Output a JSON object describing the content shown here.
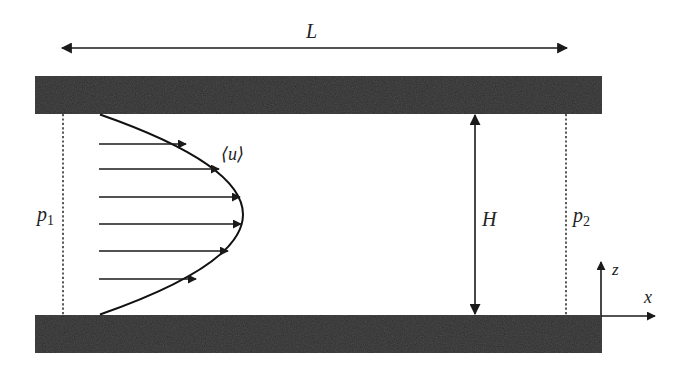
{
  "diagram": {
    "labels": {
      "length": "L",
      "height": "H",
      "velocity": "⟨u⟩",
      "pressure_inlet_base": "p",
      "pressure_inlet_sub": "1",
      "pressure_outlet_base": "p",
      "pressure_outlet_sub": "2",
      "axis_x": "x",
      "axis_z": "z"
    },
    "elements": {
      "top_plate": "solid wall (top)",
      "bottom_plate": "solid wall (bottom)",
      "velocity_profile": "parabolic profile",
      "velocity_arrow_count": 6,
      "inlet_boundary": "dotted line",
      "outlet_boundary": "dotted line"
    },
    "colors": {
      "plate": "#2b2b2b",
      "line": "#1a1a1a",
      "background": "#ffffff"
    }
  }
}
